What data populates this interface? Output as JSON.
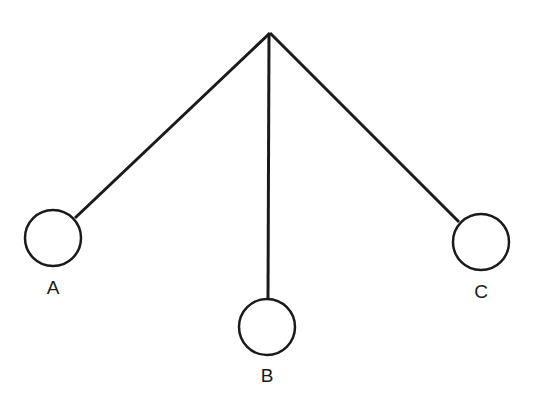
{
  "diagram": {
    "type": "pendulums",
    "pivot": {
      "x": 270,
      "y": 33
    },
    "stroke_color": "#1a1a1a",
    "bobs": [
      {
        "id": "A",
        "label": "A",
        "cx": 53,
        "cy": 238,
        "r": 28,
        "attach_x": 75,
        "attach_y": 218,
        "label_x": 53,
        "label_y": 294
      },
      {
        "id": "B",
        "label": "B",
        "cx": 267,
        "cy": 327,
        "r": 28,
        "attach_x": 268,
        "attach_y": 299,
        "label_x": 267,
        "label_y": 382
      },
      {
        "id": "C",
        "label": "C",
        "cx": 481,
        "cy": 242,
        "r": 28,
        "attach_x": 459,
        "attach_y": 222,
        "label_x": 481,
        "label_y": 298
      }
    ]
  }
}
